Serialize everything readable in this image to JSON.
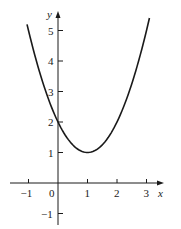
{
  "chart_data": {
    "type": "line",
    "title": "",
    "xlabel": "x",
    "ylabel": "y",
    "function": "y = x^2 - 2x + 2",
    "x": [
      -1.05,
      -1,
      -0.5,
      0,
      0.5,
      1,
      1.5,
      2,
      2.5,
      3,
      3.1
    ],
    "series": [
      {
        "name": "parabola",
        "values": [
          5.2025,
          5,
          3.25,
          2,
          1.25,
          1,
          1.25,
          2,
          3.25,
          5,
          5.41
        ]
      }
    ],
    "xlim": [
      -1.2,
      3.5
    ],
    "ylim": [
      -1.3,
      5.6
    ],
    "xticks": [
      -1,
      0,
      1,
      2,
      3
    ],
    "xtick_labels": [
      "−1",
      "0",
      "1",
      "2",
      "3"
    ],
    "yticks": [
      5,
      4,
      3,
      2,
      1,
      -1
    ],
    "ytick_labels": [
      "5",
      "4",
      "3",
      "2",
      "1",
      "−1"
    ],
    "grid": false,
    "legend": null,
    "colors": {
      "curve": "#1a1a1a",
      "axes": "#1a1a1a"
    }
  },
  "axes": {
    "x_label": "x",
    "y_label": "y",
    "origin_label": "0"
  }
}
